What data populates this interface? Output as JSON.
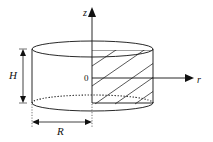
{
  "diagram": {
    "type": "cylinder-coordinate-sketch",
    "labels": {
      "z_axis": "z",
      "r_axis": "r",
      "origin": "0",
      "height": "H",
      "radius": "R"
    },
    "colors": {
      "stroke": "#111111",
      "background": "#ffffff"
    }
  }
}
